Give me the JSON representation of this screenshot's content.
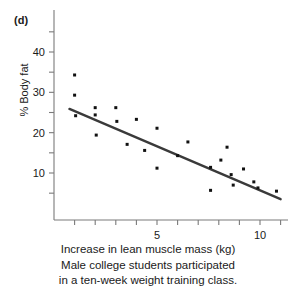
{
  "figure": {
    "panel_label": "(d)",
    "xlabel": "Increase in lean muscle mass (kg)",
    "ylabel": "% Body fat",
    "caption_line1": "Male college students participated",
    "caption_line2": "in a ten-week weight training class."
  },
  "colors": {
    "point": "#111111",
    "line": "#3a3a3a",
    "axis": "#7a7a7a",
    "text": "#1a1a1a",
    "background": "#ffffff"
  },
  "chart_data": {
    "type": "scatter",
    "title": "",
    "xlabel": "Increase in lean muscle mass (kg)",
    "ylabel": "% Body fat",
    "xlim": [
      0.6,
      11.2
    ],
    "ylim": [
      2.0,
      45.5
    ],
    "grid": false,
    "legend": null,
    "xticks": [
      1,
      2,
      3,
      4,
      5,
      6,
      7,
      8,
      9,
      10,
      11
    ],
    "xtick_labels": [
      "",
      "",
      "",
      "",
      "5",
      "",
      "",
      "",
      "",
      "10",
      ""
    ],
    "yticks": [
      5,
      10,
      15,
      20,
      25,
      30,
      35,
      40,
      45
    ],
    "ytick_labels": [
      "",
      "10",
      "",
      "20",
      "",
      "30",
      "",
      "40",
      ""
    ],
    "points": [
      {
        "x": 1.0,
        "y": 34.3
      },
      {
        "x": 1.0,
        "y": 29.3
      },
      {
        "x": 1.05,
        "y": 24.2
      },
      {
        "x": 2.0,
        "y": 26.2
      },
      {
        "x": 2.0,
        "y": 24.4
      },
      {
        "x": 2.05,
        "y": 19.4
      },
      {
        "x": 3.0,
        "y": 26.2
      },
      {
        "x": 3.05,
        "y": 22.8
      },
      {
        "x": 3.55,
        "y": 17.1
      },
      {
        "x": 4.0,
        "y": 23.3
      },
      {
        "x": 4.4,
        "y": 15.6
      },
      {
        "x": 5.0,
        "y": 21.1
      },
      {
        "x": 5.0,
        "y": 11.2
      },
      {
        "x": 6.0,
        "y": 14.3
      },
      {
        "x": 6.5,
        "y": 17.7
      },
      {
        "x": 7.6,
        "y": 11.4
      },
      {
        "x": 7.6,
        "y": 5.7
      },
      {
        "x": 8.1,
        "y": 13.2
      },
      {
        "x": 8.4,
        "y": 16.4
      },
      {
        "x": 8.6,
        "y": 9.6
      },
      {
        "x": 8.7,
        "y": 7.0
      },
      {
        "x": 9.2,
        "y": 11.0
      },
      {
        "x": 9.7,
        "y": 7.8
      },
      {
        "x": 9.9,
        "y": 6.3
      },
      {
        "x": 10.8,
        "y": 5.5
      }
    ],
    "fit_line": {
      "x0": 0.75,
      "y0": 25.9,
      "x1": 11.0,
      "y1": 3.5
    }
  }
}
